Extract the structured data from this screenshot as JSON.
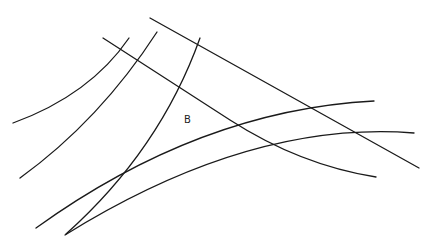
{
  "diagram": {
    "labels": [
      {
        "id": "region-b",
        "text": "B",
        "x": 184,
        "y": 114
      }
    ],
    "stroke_color": "#1a1a1a",
    "background": "#ffffff",
    "curves": [
      {
        "id": "arc-left-1",
        "d": "M13,123 Q90,95 129,38"
      },
      {
        "id": "arc-left-2",
        "d": "M20,178 Q100,120 157,32"
      },
      {
        "id": "arc-left-3",
        "d": "M66,234 Q160,150 200,38"
      },
      {
        "id": "line-top",
        "d": "M150,18 L419,168"
      },
      {
        "id": "line-second",
        "d": "M103,38 L230,120 Q300,165 376,177"
      },
      {
        "id": "arc-lower-1",
        "d": "M36,228 Q200,110 374,101"
      },
      {
        "id": "arc-lower-2",
        "d": "M65,235 Q250,120 414,133"
      }
    ]
  }
}
